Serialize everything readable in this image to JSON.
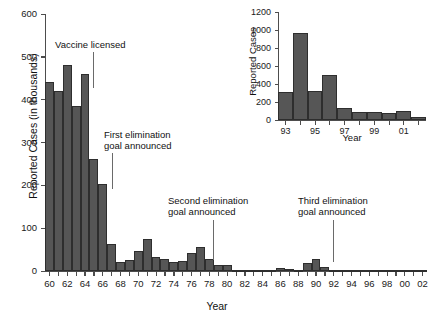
{
  "chart_data": [
    {
      "id": "main",
      "type": "bar",
      "title": "",
      "xlabel": "Year",
      "ylabel": "Reported Cases (in thousands)",
      "ylim": [
        0,
        600
      ],
      "yticks": [
        0,
        100,
        200,
        300,
        400,
        500,
        600
      ],
      "xlim": [
        1959.5,
        2002.5
      ],
      "xtick_labels": [
        "60",
        "62",
        "64",
        "66",
        "68",
        "70",
        "72",
        "74",
        "76",
        "78",
        "80",
        "82",
        "84",
        "86",
        "88",
        "90",
        "92",
        "94",
        "96",
        "98",
        "00",
        "02"
      ],
      "grid": false,
      "legend": "none",
      "categories": [
        1960,
        1961,
        1962,
        1963,
        1964,
        1965,
        1966,
        1967,
        1968,
        1969,
        1970,
        1971,
        1972,
        1973,
        1974,
        1975,
        1976,
        1977,
        1978,
        1979,
        1980,
        1981,
        1982,
        1983,
        1984,
        1985,
        1986,
        1987,
        1988,
        1989,
        1990,
        1991,
        1992,
        1993,
        1994,
        1995,
        1996,
        1997,
        1998,
        1999,
        2000,
        2001,
        2002
      ],
      "values": [
        441,
        420,
        481,
        385,
        459,
        261,
        204,
        62,
        22,
        26,
        47,
        75,
        32,
        27,
        22,
        24,
        41,
        57,
        27,
        14,
        14,
        3,
        2,
        1,
        3,
        3,
        6,
        4,
        3,
        18,
        28,
        10,
        2,
        0.3,
        1,
        0.3,
        0.5,
        0.1,
        0.1,
        0.1,
        0.1,
        0.1,
        0.04
      ],
      "annotations": [
        {
          "text": "Vaccine licensed",
          "points_to_year": 1963,
          "label_x": 55,
          "label_y": 40,
          "leader_x": 93,
          "leader_y": 52,
          "leader_h": 36
        },
        {
          "text": "First elimination\ngoal announced",
          "points_to_year": 1967,
          "label_x": 104,
          "label_y": 130,
          "leader_x": 112,
          "leader_y": 153,
          "leader_h": 36
        },
        {
          "text": "Second elimination\ngoal announced",
          "points_to_year": 1979,
          "label_x": 168,
          "label_y": 196,
          "leader_x": 213,
          "leader_y": 220,
          "leader_h": 40
        },
        {
          "text": "Third elimination\ngoal announced",
          "points_to_year": 1992,
          "label_x": 298,
          "label_y": 196,
          "leader_x": 333,
          "leader_y": 220,
          "leader_h": 42
        }
      ]
    },
    {
      "id": "inset",
      "type": "bar",
      "title": "",
      "xlabel": "Year",
      "ylabel": "Reported Cases",
      "ylim": [
        0,
        1200
      ],
      "yticks": [
        0,
        200,
        400,
        600,
        800,
        1000,
        1200
      ],
      "xtick_labels": [
        "93",
        "95",
        "97",
        "99",
        "01"
      ],
      "grid": false,
      "legend": "none",
      "categories": [
        1993,
        1994,
        1995,
        1996,
        1997,
        1998,
        1999,
        2000,
        2001,
        2002
      ],
      "values": [
        312,
        963,
        318,
        500,
        130,
        89,
        86,
        81,
        100,
        30
      ]
    }
  ]
}
